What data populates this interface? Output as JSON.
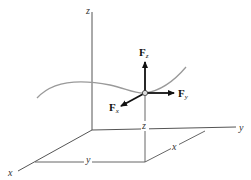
{
  "diagram": {
    "axes": {
      "x_label": "x",
      "y_label": "y",
      "z_label": "z"
    },
    "point_coordinates": {
      "z_label": "z",
      "x_label": "x",
      "y_label": "y"
    },
    "forces": [
      {
        "id": "Fz",
        "base": "F",
        "subscript": "z",
        "direction": "up"
      },
      {
        "id": "Fy",
        "base": "F",
        "subscript": "y",
        "direction": "right"
      },
      {
        "id": "Fx",
        "base": "F",
        "subscript": "x",
        "direction": "down-left"
      }
    ],
    "colors": {
      "axis": "#555555",
      "curve": "#9a9a9a",
      "force": "#111111",
      "point_fill": "#dddddd"
    }
  }
}
